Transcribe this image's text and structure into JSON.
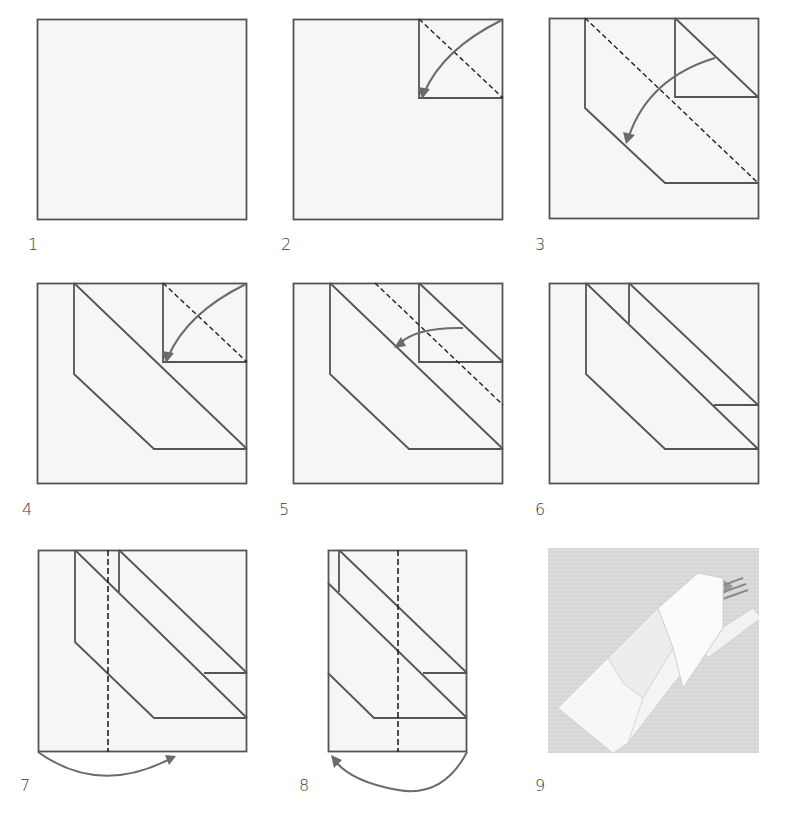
{
  "diagram": {
    "colors": {
      "paper_fill": "#f6f6f6",
      "line": "#555555",
      "arrow": "#6b6b6b",
      "dashed": "#222222",
      "photo_bg": "#d8d8d8"
    },
    "steps": [
      {
        "number": "1",
        "label": "1",
        "description": "Square napkin laid flat"
      },
      {
        "number": "2",
        "label": "2",
        "description": "Fold top-right corner down along dashed diagonal"
      },
      {
        "number": "3",
        "label": "3",
        "description": "Fold along long dashed diagonal toward lower left"
      },
      {
        "number": "4",
        "label": "4",
        "description": "Fold top-right corner down along dashed diagonal"
      },
      {
        "number": "5",
        "label": "5",
        "description": "Fold along dashed diagonal toward left"
      },
      {
        "number": "6",
        "label": "6",
        "description": "Result after folding strips"
      },
      {
        "number": "7",
        "label": "7",
        "description": "Fold left side under along dashed vertical line"
      },
      {
        "number": "8",
        "label": "8",
        "description": "Fold right side under along dashed vertical line"
      },
      {
        "number": "9",
        "label": "9",
        "description": "Finished napkin pouch holding cutlery"
      }
    ],
    "footer_caption": ""
  }
}
